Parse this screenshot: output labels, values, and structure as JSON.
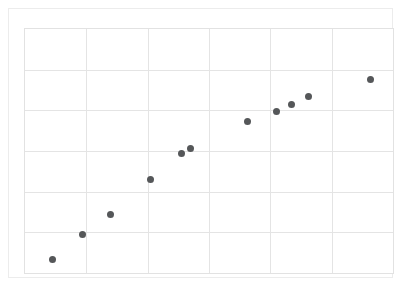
{
  "chart_data": {
    "type": "scatter",
    "title": "",
    "subtitle": "",
    "xlabel": "",
    "ylabel": "",
    "xlim": [
      0,
      6
    ],
    "ylim": [
      0,
      6
    ],
    "xticks": [
      0,
      1,
      2,
      3,
      4,
      5,
      6
    ],
    "yticks": [
      0,
      1,
      2,
      3,
      4,
      5,
      6
    ],
    "xtick_labels": [],
    "ytick_labels": [],
    "grid": true,
    "legend": null,
    "legend_position": "none",
    "annotations": [],
    "marker": {
      "shape": "circle",
      "color": "#555759",
      "size_px": 7,
      "filled": true
    },
    "series": [
      {
        "name": "series-1",
        "color": "#555759",
        "points": [
          {
            "x": 0.45,
            "y": 0.33
          },
          {
            "x": 0.93,
            "y": 0.94
          },
          {
            "x": 1.4,
            "y": 1.44
          },
          {
            "x": 2.05,
            "y": 2.29
          },
          {
            "x": 2.55,
            "y": 2.93
          },
          {
            "x": 2.7,
            "y": 3.07
          },
          {
            "x": 3.62,
            "y": 3.73
          },
          {
            "x": 4.1,
            "y": 3.97
          },
          {
            "x": 4.35,
            "y": 4.14
          },
          {
            "x": 4.63,
            "y": 4.33
          },
          {
            "x": 5.63,
            "y": 4.77
          }
        ]
      }
    ],
    "colors": {
      "background": "#ffffff",
      "grid": "#e4e4e4",
      "axis_border": "#e2e2e2",
      "outer_frame": "#ececec",
      "marker": "#555759"
    }
  }
}
